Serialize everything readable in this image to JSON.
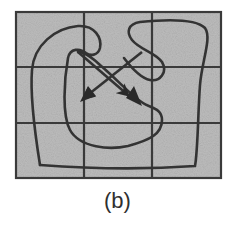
{
  "figure": {
    "caption": "(b)",
    "grid": {
      "rows": 3,
      "cols": 3,
      "background_color": "#bdbdbd",
      "line_color": "#3a3a3a"
    },
    "curves": [
      {
        "name": "left-curve",
        "description": "path starting at lower-left, looping up and around, ending in arrowhead pointing down-left toward center"
      },
      {
        "name": "right-curve",
        "description": "path starting at right side, looping up and around, ending in arrowhead pointing down-right toward center"
      }
    ],
    "stroke_color": "#333333"
  }
}
